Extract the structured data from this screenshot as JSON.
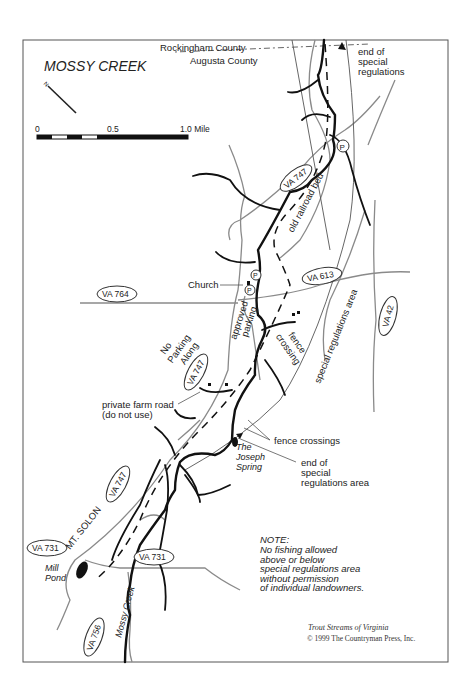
{
  "map": {
    "title": "MOSSY CREEK",
    "county_north": "Rockingham County",
    "county_south": "Augusta County",
    "north_arrow_label": "N",
    "scale": {
      "ticks": [
        "0",
        "0.5",
        "1.0 Mile"
      ]
    },
    "labels": {
      "end_special_top": [
        "end of",
        "special",
        "regulations"
      ],
      "old_railroad_bed": "old railroad bed",
      "church": "Church",
      "approved_parking": [
        "approved",
        "parking"
      ],
      "no_parking_along": [
        "No",
        "Parking",
        "Along"
      ],
      "fence_crossing": [
        "fence",
        "crossing"
      ],
      "special_regulations_area": "special regulations area",
      "private_farm_road": [
        "private farm road",
        "(do not use)"
      ],
      "fence_crossings": "fence crossings",
      "joseph_spring": [
        "The",
        "Joseph",
        "Spring"
      ],
      "end_special_bottom": [
        "end of",
        "special",
        "regulations area"
      ],
      "mt_solon": "MT. SOLON",
      "mill_pond": [
        "Mill",
        "Pond"
      ],
      "mossy_creek": "Mossy Creek",
      "parking_symbol": "P"
    },
    "routes": [
      "VA 747",
      "VA 613",
      "VA 764",
      "VA 747",
      "VA 42",
      "VA 747",
      "VA 731",
      "VA 731",
      "VA 756"
    ],
    "note": {
      "heading": "NOTE:",
      "lines": [
        "No fishing allowed",
        "above or below",
        "special regulations area",
        "without permission",
        "of individual landowners."
      ]
    },
    "credit": {
      "book": "Trout Streams of Virginia",
      "copyright": "© 1999 The Countryman Press, Inc."
    },
    "colors": {
      "frame": "#555555",
      "road": "#8a8a8a",
      "stream": "#111111"
    }
  }
}
